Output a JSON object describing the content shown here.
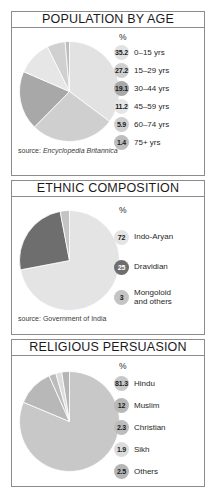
{
  "document": {
    "background": "#ffffff",
    "border_color": "#8c8c8c"
  },
  "panels": [
    {
      "id": "population-by-age",
      "title": "POPULATION BY AGE",
      "percent_header": "%",
      "source_label": "source: ",
      "source_name": "Encyclopedia Britannica",
      "rows": [
        {
          "value": "35.2",
          "label": "0–15 yrs",
          "color": "#e2e2e2",
          "text_dark": true
        },
        {
          "value": "27.2",
          "label": "15–29 yrs",
          "color": "#cfcfcf",
          "text_dark": true
        },
        {
          "value": "19.1",
          "label": "30–44 yrs",
          "color": "#a8a8a8",
          "text_dark": true
        },
        {
          "value": "11.2",
          "label": "45–59 yrs",
          "color": "#e6e6e6",
          "text_dark": true
        },
        {
          "value": "5.9",
          "label": "60–74 yrs",
          "color": "#d0d0d0",
          "text_dark": true
        },
        {
          "value": "1.4",
          "label": "75+ yrs",
          "color": "#bdbdbd",
          "text_dark": true
        }
      ]
    },
    {
      "id": "ethnic-composition",
      "title": "ETHNIC COMPOSITION",
      "percent_header": "%",
      "source_label": "source: ",
      "source_name": "Government of India",
      "rows": [
        {
          "value": "72",
          "label": "Indo-Aryan",
          "color": "#e4e4e4",
          "text_dark": true
        },
        {
          "value": "25",
          "label": "Dravidian",
          "color": "#6e6e6e",
          "text_dark": false
        },
        {
          "value": "3",
          "label": "Mongoloid\nand others",
          "color": "#c4c4c4",
          "text_dark": true
        }
      ]
    },
    {
      "id": "religious-persuasion",
      "title": "RELIGIOUS PERSUASION",
      "percent_header": "%",
      "source_label": "",
      "source_name": "",
      "rows": [
        {
          "value": "81.3",
          "label": "Hindu",
          "color": "#c8c8c8",
          "text_dark": true
        },
        {
          "value": "12",
          "label": "Muslim",
          "color": "#b8b8b8",
          "text_dark": true
        },
        {
          "value": "2.3",
          "label": "Christian",
          "color": "#bcbcbc",
          "text_dark": true
        },
        {
          "value": "1.9",
          "label": "Sikh",
          "color": "#dcdcdc",
          "text_dark": true
        },
        {
          "value": "2.5",
          "label": "Others",
          "color": "#b5b5b5",
          "text_dark": true
        }
      ]
    }
  ],
  "chart_data": [
    {
      "type": "pie",
      "title": "POPULATION BY AGE",
      "ylabel": "%",
      "source": "source: Encyclopedia Britannica",
      "start_angle": 0,
      "direction": "clockwise",
      "categories": [
        "0–15 yrs",
        "15–29 yrs",
        "30–44 yrs",
        "45–59 yrs",
        "60–74 yrs",
        "75+ yrs"
      ],
      "values": [
        35.2,
        27.2,
        19.1,
        11.2,
        5.9,
        1.4
      ],
      "colors": [
        "#e2e2e2",
        "#cfcfcf",
        "#a8a8a8",
        "#e6e6e6",
        "#d0d0d0",
        "#bdbdbd"
      ],
      "legend": "right"
    },
    {
      "type": "pie",
      "title": "ETHNIC COMPOSITION",
      "ylabel": "%",
      "source": "source: Government of India",
      "start_angle": 0,
      "direction": "clockwise",
      "categories": [
        "Indo-Aryan",
        "Dravidian",
        "Mongoloid and others"
      ],
      "values": [
        72,
        25,
        3
      ],
      "colors": [
        "#e4e4e4",
        "#6e6e6e",
        "#c4c4c4"
      ],
      "legend": "right"
    },
    {
      "type": "pie",
      "title": "RELIGIOUS PERSUASION",
      "ylabel": "%",
      "source": "",
      "start_angle": 0,
      "direction": "clockwise",
      "categories": [
        "Hindu",
        "Muslim",
        "Christian",
        "Sikh",
        "Others"
      ],
      "values": [
        81.3,
        12,
        2.3,
        1.9,
        2.5
      ],
      "colors": [
        "#c8c8c8",
        "#b8b8b8",
        "#bcbcbc",
        "#dcdcdc",
        "#b5b5b5"
      ],
      "legend": "right"
    }
  ]
}
